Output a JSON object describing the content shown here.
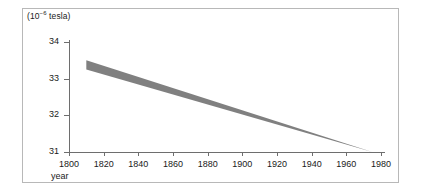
{
  "figure": {
    "unit_label_prefix": "(10",
    "unit_label_exponent": "−6",
    "unit_label_suffix": " tesla)",
    "band_color": "#808080",
    "axis_color": "#6e6e6e",
    "border_color": "#b8b8b8"
  },
  "chart_data": {
    "type": "area",
    "title": "",
    "subtitle": "",
    "xlabel": "year",
    "ylabel": "(10−6 tesla)",
    "xlim": [
      1800,
      1980
    ],
    "ylim": [
      31,
      34
    ],
    "grid": false,
    "legend": null,
    "xticks": [
      1800,
      1820,
      1840,
      1860,
      1880,
      1900,
      1920,
      1940,
      1960,
      1980
    ],
    "xtick_labels": [
      "1800",
      "1820",
      "1840",
      "1860",
      "1880",
      "1900",
      "1920",
      "1940",
      "1960",
      "1980"
    ],
    "yticks": [
      31,
      32,
      33,
      34
    ],
    "ytick_labels": [
      "31",
      "32",
      "33",
      "34"
    ],
    "series": [
      {
        "name": "upper bound",
        "x": [
          1810,
          1975
        ],
        "values": [
          33.5,
          31.0
        ]
      },
      {
        "name": "lower bound",
        "x": [
          1810,
          1975
        ],
        "values": [
          33.25,
          31.0
        ]
      }
    ],
    "band": {
      "x_start": 1810,
      "x_end": 1975,
      "y_start_upper": 33.5,
      "y_start_lower": 33.25,
      "y_end_upper": 31.0,
      "y_end_lower": 31.0
    },
    "annotations": []
  }
}
